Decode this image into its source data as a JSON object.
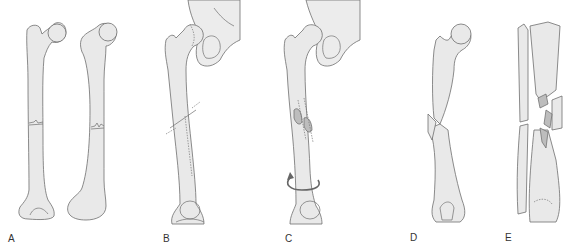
{
  "figure": {
    "background_color": "#ffffff",
    "bone_fill_color": "#e9e9e9",
    "outline_color": "#6f6f6f",
    "fragment_color": "#bdbdbd",
    "panels": [
      {
        "id": "A",
        "label": "A",
        "depicts": "transverse fracture, two femur views"
      },
      {
        "id": "B",
        "label": "B",
        "depicts": "oblique fracture with hip joint"
      },
      {
        "id": "C",
        "label": "C",
        "depicts": "spiral fracture with rotation arrow"
      },
      {
        "id": "D",
        "label": "D",
        "depicts": "butterfly fragment fracture"
      },
      {
        "id": "E",
        "label": "E",
        "depicts": "comminuted tibia/fibula fracture"
      }
    ]
  }
}
